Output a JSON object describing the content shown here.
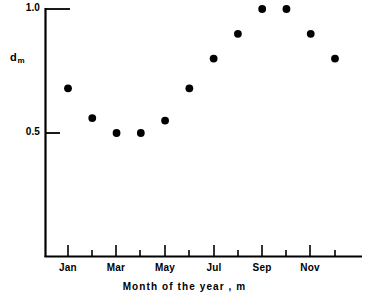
{
  "chart_data": {
    "type": "scatter",
    "title": "",
    "xlabel": "Month of the year , m",
    "ylabel": "d",
    "ylabel_sub": "m",
    "categories": [
      "Jan",
      "Feb",
      "Mar",
      "Apr",
      "May",
      "Jun",
      "Jul",
      "Aug",
      "Sep",
      "Oct",
      "Nov",
      "Dec"
    ],
    "x": [
      1,
      2,
      3,
      4,
      5,
      6,
      7,
      8,
      9,
      10,
      11,
      12
    ],
    "values": [
      0.68,
      0.56,
      0.5,
      0.5,
      0.55,
      0.68,
      0.8,
      0.9,
      1.0,
      1.0,
      0.9,
      0.8
    ],
    "ylim": [
      0.0,
      1.02
    ],
    "xlim": [
      0.3,
      13.0
    ],
    "ytick_values": [
      1.0,
      0.5
    ],
    "ytick_labels": [
      "1.0",
      "0.5"
    ],
    "xtick_labels_shown": [
      "Jan",
      "Mar",
      "May",
      "Jul",
      "Sep",
      "Nov"
    ],
    "grid": false,
    "legend": false,
    "marker": "filled-circle",
    "marker_color": "#000000",
    "axis_color": "#000000"
  },
  "axes": {
    "y_label_main": "d",
    "y_label_sub": "m",
    "y_tick_1": "1.0",
    "y_tick_05": "0.5",
    "x_title": "Month of the year , m",
    "x_tick_jan": "Jan",
    "x_tick_mar": "Mar",
    "x_tick_may": "May",
    "x_tick_jul": "Jul",
    "x_tick_sep": "Sep",
    "x_tick_nov": "Nov"
  }
}
